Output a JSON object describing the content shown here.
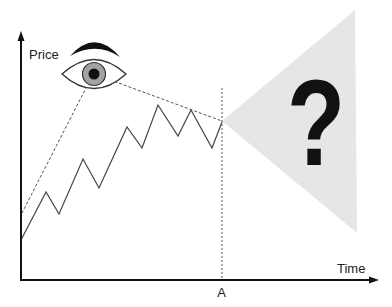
{
  "axes": {
    "y_label": "Price",
    "x_label": "Time",
    "marker_label": "A"
  },
  "future": {
    "symbol": "?",
    "cone_points": "222,121 355,10 357,233"
  },
  "price_line": {
    "points": "21,240 46,192 59,214 83,159 99,188 127,127 142,148 158,105 178,136 191,110 212,148 222,122"
  },
  "sight_lines": {
    "lower": {
      "x1": "87",
      "y1": "86",
      "x2": "21",
      "y2": "215"
    },
    "upper": {
      "x1": "105",
      "y1": "78",
      "x2": "222",
      "y2": "121"
    }
  },
  "colors": {
    "axis": "#111111",
    "line": "#444444",
    "cone": "#e6e6e6",
    "iris": "#a3a3a3",
    "pupil": "#111111"
  }
}
